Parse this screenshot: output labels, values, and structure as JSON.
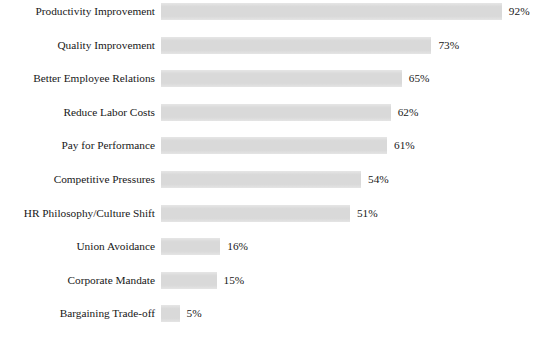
{
  "page": {
    "clipped_title_fragment": "",
    "background_color": "#ffffff",
    "bar_color": "#d9d9d9",
    "text_color": "#171717"
  },
  "chart_data": {
    "type": "bar",
    "orientation": "horizontal",
    "title": "",
    "xlabel": "",
    "ylabel": "",
    "xlim": [
      0,
      100
    ],
    "grid": false,
    "legend": null,
    "value_suffix": "%",
    "categories": [
      "Productivity Improvement",
      "Quality Improvement",
      "Better Employee Relations",
      "Reduce Labor Costs",
      "Pay for Performance",
      "Competitive Pressures",
      "HR Philosophy/Culture Shift",
      "Union Avoidance",
      "Corporate Mandate",
      "Bargaining Trade-off"
    ],
    "values": [
      92,
      73,
      65,
      62,
      61,
      54,
      51,
      16,
      15,
      5
    ],
    "value_labels": [
      "92%",
      "73%",
      "65%",
      "62%",
      "61%",
      "54%",
      "51%",
      "16%",
      "15%",
      "5%"
    ]
  },
  "geometry": {
    "bar_origin_x": 161,
    "px_per_percent": 3.705,
    "row_pitch": 33.6,
    "first_row_top": 2,
    "bar_height": 17,
    "value_gap": 7
  }
}
